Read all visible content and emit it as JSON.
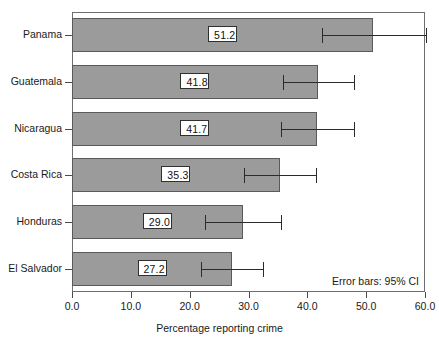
{
  "chart_data": {
    "type": "bar",
    "orientation": "horizontal",
    "title": "",
    "xlabel": "Percentage reporting crime",
    "ylabel": "",
    "xlim": [
      0.0,
      60.0
    ],
    "xticks": [
      "0.0",
      "10.0",
      "20.0",
      "30.0",
      "40.0",
      "50.0",
      "60.0"
    ],
    "xtick_values": [
      0,
      10,
      20,
      30,
      40,
      50,
      60
    ],
    "grid": false,
    "legend": false,
    "annotation": "Error bars: 95% CI",
    "categories": [
      "Panama",
      "Guatemala",
      "Nicaragua",
      "Costa Rica",
      "Honduras",
      "El Salvador"
    ],
    "values": [
      51.2,
      41.8,
      41.7,
      35.3,
      29.0,
      27.2
    ],
    "value_labels": [
      "51.2",
      "41.8",
      "41.7",
      "35.3",
      "29.0",
      "27.2"
    ],
    "error_low": [
      42.5,
      35.8,
      35.6,
      29.2,
      22.6,
      21.9
    ],
    "error_high": [
      60.1,
      48.0,
      47.9,
      41.5,
      35.5,
      32.5
    ],
    "bar_color": "#9b9b9b",
    "bar_edge_color": "#5a5a5a",
    "error_color": "#2b2b2b",
    "background_color": "#ffffff",
    "axis_color": "#6e6e6e"
  },
  "axis": {
    "x_title": "Percentage reporting crime"
  }
}
